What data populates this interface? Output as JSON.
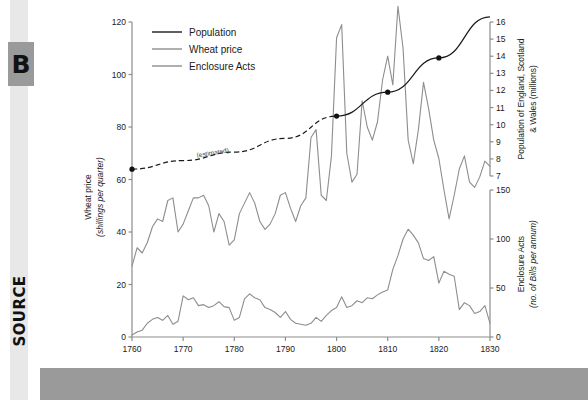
{
  "sidebar": {
    "letter_badge": "B",
    "source_label": "SOURCE"
  },
  "chart_data": {
    "type": "line",
    "title": "",
    "xlabel": "",
    "x": [
      1760,
      1761,
      1762,
      1763,
      1764,
      1765,
      1766,
      1767,
      1768,
      1769,
      1770,
      1771,
      1772,
      1773,
      1774,
      1775,
      1776,
      1777,
      1778,
      1779,
      1780,
      1781,
      1782,
      1783,
      1784,
      1785,
      1786,
      1787,
      1788,
      1789,
      1790,
      1791,
      1792,
      1793,
      1794,
      1795,
      1796,
      1797,
      1798,
      1799,
      1800,
      1801,
      1802,
      1803,
      1804,
      1805,
      1806,
      1807,
      1808,
      1809,
      1810,
      1811,
      1812,
      1813,
      1814,
      1815,
      1816,
      1817,
      1818,
      1819,
      1820,
      1821,
      1822,
      1823,
      1824,
      1825,
      1826,
      1827,
      1828,
      1829,
      1830
    ],
    "xlim": [
      1760,
      1830
    ],
    "xticks": [
      1760,
      1770,
      1780,
      1790,
      1800,
      1810,
      1820,
      1830
    ],
    "xticklabels": [
      "1760",
      "1770",
      "1780",
      "1790",
      "1800",
      "1810",
      "1820",
      "1830"
    ],
    "grid": false,
    "legend_position": "top-left",
    "axes": [
      {
        "id": "wheat-price-axis",
        "side": "left",
        "label_line1": "Wheat price",
        "label_line2": "(shillings per quarter)",
        "lim": [
          0,
          120
        ],
        "ticks": [
          0,
          20,
          40,
          60,
          80,
          100,
          120
        ],
        "ticklabels": [
          "0",
          "20",
          "40",
          "60",
          "80",
          "100",
          "120"
        ]
      },
      {
        "id": "population-axis",
        "side": "right-upper",
        "label_line1": "Population of England, Scotland",
        "label_line2": "& Wales (millions)",
        "lim": [
          7,
          16
        ],
        "ticks": [
          7,
          8,
          9,
          10,
          11,
          12,
          13,
          14,
          15,
          16
        ],
        "ticklabels": [
          "7",
          "8",
          "9",
          "10",
          "11",
          "12",
          "13",
          "14",
          "15",
          "16"
        ]
      },
      {
        "id": "enclosure-acts-axis",
        "side": "right-lower",
        "label_line1": "Enclosure Acts",
        "label_line2": "(no. of Bills per annum)",
        "lim": [
          0,
          150
        ],
        "ticks": [
          0,
          50,
          100,
          150
        ],
        "ticklabels": [
          "0",
          "50",
          "100",
          "150"
        ]
      }
    ],
    "series": [
      {
        "name": "Population",
        "axis": "population-axis",
        "color": "#1a1a1a",
        "style": "solid-with-dashed-estimate",
        "annotation": "(estimated)",
        "markers_x": [
          1760,
          1800,
          1810,
          1820
        ],
        "markers_y": [
          7.4,
          10.5,
          11.9,
          13.9
        ],
        "x": [
          1760,
          1770,
          1780,
          1790,
          1800,
          1810,
          1820,
          1830
        ],
        "values": [
          7.4,
          7.9,
          8.4,
          9.2,
          10.5,
          11.9,
          13.9,
          16.3
        ]
      },
      {
        "name": "Wheat price",
        "axis": "wheat-price-axis",
        "color": "#8d8d8d",
        "style": "solid",
        "values": [
          27,
          34,
          32,
          36,
          42,
          45,
          44,
          52,
          53,
          40,
          43,
          48,
          53,
          53,
          54,
          50,
          40,
          47,
          44,
          35,
          37,
          47,
          51,
          55,
          51,
          44,
          41,
          43,
          47,
          54,
          55,
          49,
          44,
          50,
          53,
          76,
          79,
          54,
          52,
          69,
          114,
          119,
          70,
          59,
          62,
          90,
          80,
          75,
          82,
          98,
          107,
          96,
          126,
          110,
          75,
          66,
          79,
          97,
          87,
          75,
          68,
          56,
          45,
          54,
          64,
          69,
          59,
          57,
          61,
          67,
          65
        ]
      },
      {
        "name": "Enclosure Acts",
        "axis": "enclosure-acts-axis",
        "color": "#8d8d8d",
        "style": "solid",
        "values": [
          2,
          5,
          7,
          14,
          18,
          20,
          17,
          22,
          13,
          16,
          42,
          38,
          40,
          32,
          33,
          30,
          32,
          36,
          31,
          30,
          17,
          20,
          39,
          44,
          40,
          38,
          30,
          28,
          25,
          20,
          26,
          18,
          14,
          13,
          12,
          14,
          20,
          16,
          22,
          27,
          30,
          41,
          30,
          32,
          37,
          35,
          40,
          39,
          43,
          46,
          48,
          69,
          83,
          100,
          110,
          104,
          96,
          80,
          78,
          82,
          55,
          67,
          64,
          62,
          28,
          35,
          32,
          24,
          26,
          32,
          14
        ]
      }
    ]
  }
}
